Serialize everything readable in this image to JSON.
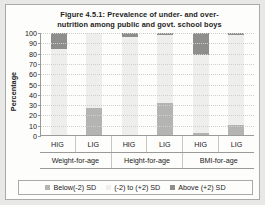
{
  "figure": {
    "title_line1": "Figure 4.5.1: Prevalence of under- and over-",
    "title_line2": "nutrition among public and govt. school boys"
  },
  "chart_data": {
    "type": "bar",
    "subtype": "stacked-100",
    "xlabel": "",
    "ylabel": "Percentage",
    "ylim": [
      0,
      100
    ],
    "yticks": [
      0,
      10,
      20,
      30,
      40,
      50,
      60,
      70,
      80,
      90,
      100
    ],
    "grid": true,
    "legend_position": "bottom",
    "categories": [
      "HIG",
      "LIG",
      "HIG",
      "LIG",
      "HIG",
      "LIG"
    ],
    "groups": [
      "Weight-for-age",
      "Height-for-age",
      "BMI-for-age"
    ],
    "series": [
      {
        "name": "Below(-2) SD",
        "color": "#b4b4b2",
        "values": [
          0,
          26,
          0,
          31,
          2,
          10
        ]
      },
      {
        "name": "(-2) to (+2) SD",
        "color": "#eeeeec",
        "values": [
          84,
          74,
          96,
          67,
          76,
          88
        ]
      },
      {
        "name": "Above (+2) SD",
        "color": "#8e8e8c",
        "values": [
          16,
          0,
          4,
          2,
          22,
          2
        ]
      }
    ]
  }
}
